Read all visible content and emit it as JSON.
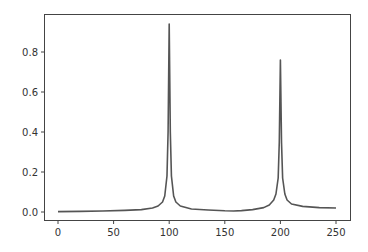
{
  "chart_data": {
    "type": "line",
    "title": "",
    "xlabel": "",
    "ylabel": "",
    "xlim": [
      -12,
      262
    ],
    "ylim": [
      -0.015,
      0.99
    ],
    "grid": false,
    "legend": null,
    "x_ticks": [
      0,
      50,
      100,
      150,
      200,
      250
    ],
    "y_ticks": [
      0.0,
      0.2,
      0.4,
      0.6,
      0.8
    ],
    "x_tick_labels": [
      "0",
      "50",
      "100",
      "150",
      "200",
      "250"
    ],
    "y_tick_labels": [
      "0.0",
      "0.2",
      "0.4",
      "0.6",
      "0.8"
    ],
    "series": [
      {
        "name": "signal",
        "color": "#555555",
        "x": [
          0,
          20,
          40,
          60,
          75,
          85,
          90,
          94,
          96,
          98,
          99,
          100,
          101,
          102,
          104,
          106,
          110,
          120,
          135,
          150,
          158,
          165,
          175,
          185,
          190,
          194,
          196,
          198,
          199,
          200,
          201,
          202,
          204,
          206,
          210,
          220,
          235,
          250
        ],
        "y": [
          0.002,
          0.003,
          0.005,
          0.008,
          0.012,
          0.02,
          0.03,
          0.05,
          0.08,
          0.18,
          0.4,
          0.94,
          0.4,
          0.18,
          0.08,
          0.05,
          0.03,
          0.015,
          0.01,
          0.006,
          0.005,
          0.007,
          0.012,
          0.022,
          0.035,
          0.06,
          0.09,
          0.17,
          0.35,
          0.76,
          0.35,
          0.17,
          0.09,
          0.06,
          0.04,
          0.028,
          0.022,
          0.02
        ]
      }
    ]
  }
}
